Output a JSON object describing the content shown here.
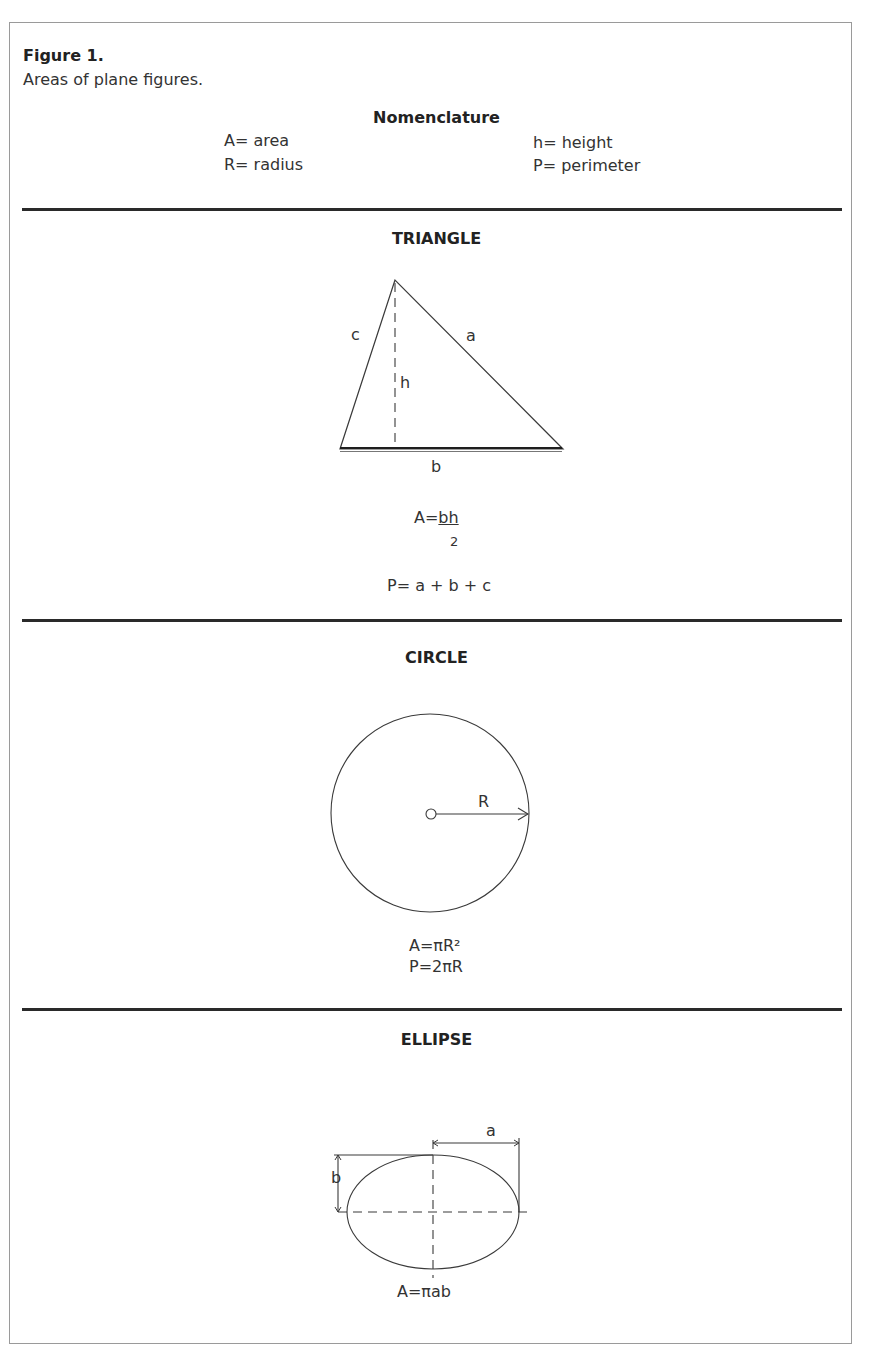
{
  "figure": {
    "label": "Figure 1.",
    "caption": "Areas of plane figures."
  },
  "nomenclature": {
    "title": "Nomenclature",
    "items": [
      {
        "symbol": "A",
        "text": "A= area"
      },
      {
        "symbol": "R",
        "text": "R= radius"
      },
      {
        "symbol": "h",
        "text": "h= height"
      },
      {
        "symbol": "P",
        "text": "P= perimeter"
      }
    ]
  },
  "sections": {
    "triangle": {
      "title": "TRIANGLE",
      "labels": {
        "a": "a",
        "b": "b",
        "c": "c",
        "h": "h"
      },
      "area_prefix": "A=",
      "area_numerator": "bh",
      "area_denominator": "2",
      "perimeter": "P= a + b + c"
    },
    "circle": {
      "title": "CIRCLE",
      "labels": {
        "R": "R"
      },
      "area": "A=πR²",
      "perimeter": "P=2πR"
    },
    "ellipse": {
      "title": "ELLIPSE",
      "labels": {
        "a": "a",
        "b": "b"
      },
      "area": "A=πab"
    }
  },
  "colors": {
    "line": "#3a3a3a",
    "rule": "#2a2a2a",
    "frame": "#9a9a9a"
  }
}
